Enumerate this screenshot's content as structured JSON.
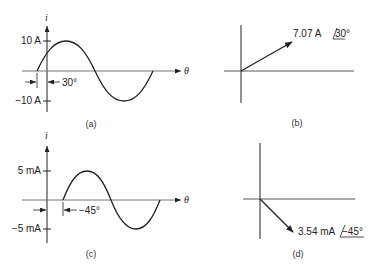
{
  "figure": {
    "panels": [
      {
        "id": "a",
        "type": "sinusoid",
        "caption": "(a)",
        "y_axis_label": "i",
        "x_axis_label": "θ",
        "y_ticks": [
          "10 A",
          "−10 A"
        ],
        "phase_annotation": "30°",
        "amplitude": "10 A",
        "phase_shift_deg": 30
      },
      {
        "id": "b",
        "type": "phasor",
        "caption": "(b)",
        "magnitude_label": "7.07 A",
        "angle_label": "30°",
        "angle_deg": 30
      },
      {
        "id": "c",
        "type": "sinusoid",
        "caption": "(c)",
        "y_axis_label": "i",
        "x_axis_label": "θ",
        "y_ticks": [
          "5 mA",
          "−5 mA"
        ],
        "phase_annotation": "−45°",
        "amplitude": "5 mA",
        "phase_shift_deg": -45
      },
      {
        "id": "d",
        "type": "phasor",
        "caption": "(d)",
        "magnitude_label": "3.54 mA",
        "angle_label": "−45°",
        "angle_deg": -45
      }
    ]
  }
}
